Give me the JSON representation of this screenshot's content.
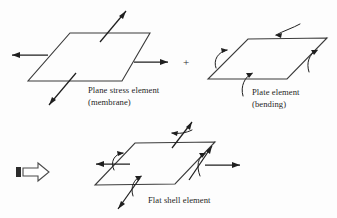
{
  "figure": {
    "name": "flat-shell-element-decomposition",
    "background_color": "#fdfdfd",
    "line_color": "#3a3a3a",
    "arrow_color": "#1f1f1f",
    "operator": "+"
  },
  "plane_stress": {
    "caption_line1": "Plane stress element",
    "caption_line2": "(membrane)",
    "description": "parallelogram with in-plane membrane force arrows",
    "arrows": [
      {
        "name": "left-axial-force",
        "direction": "left"
      },
      {
        "name": "right-axial-force",
        "direction": "right"
      },
      {
        "name": "upper-shear-force",
        "direction": "up-right"
      },
      {
        "name": "lower-shear-force",
        "direction": "down-left"
      }
    ]
  },
  "plate": {
    "caption_line1": "Plate element",
    "caption_line2": "(bending)",
    "description": "parallelogram with out-of-plane bending moment arrows",
    "arrows": [
      {
        "name": "top-edge-moment",
        "direction": "curved-left"
      },
      {
        "name": "left-edge-moment",
        "direction": "curved-right"
      },
      {
        "name": "bottom-edge-moment",
        "direction": "curved-up"
      },
      {
        "name": "right-edge-moment",
        "direction": "curved-up"
      }
    ]
  },
  "flat_shell": {
    "caption_line1": "Flat shell element",
    "caption_line2": "",
    "description": "parallelogram combining membrane forces and bending moments",
    "arrows": [
      {
        "name": "left-axial-force",
        "direction": "left"
      },
      {
        "name": "right-axial-force",
        "direction": "right"
      },
      {
        "name": "left-edge-moment",
        "direction": "curved-right"
      },
      {
        "name": "right-edge-moment",
        "direction": "curved-up"
      },
      {
        "name": "top-shear-force",
        "direction": "up-right"
      },
      {
        "name": "bottom-shear-force",
        "direction": "down-left"
      },
      {
        "name": "top-edge-moment",
        "direction": "curved-left"
      },
      {
        "name": "bottom-edge-moment",
        "direction": "curved-up"
      }
    ]
  }
}
